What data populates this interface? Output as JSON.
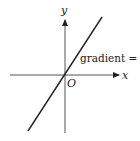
{
  "diagram": {
    "axes": {
      "x_label": "x",
      "y_label": "y",
      "origin_label": "O",
      "origin": [
        65,
        75
      ],
      "x_axis": {
        "from": [
          10,
          75
        ],
        "to": [
          119,
          75
        ]
      },
      "y_axis": {
        "from": [
          65,
          133
        ],
        "to": [
          65,
          20
        ]
      }
    },
    "line": {
      "from": [
        28,
        131
      ],
      "to": [
        102,
        17
      ],
      "annotation": "gradient = 5"
    },
    "colors": {
      "axis": "#555555",
      "line": "#222222",
      "text": "#222222",
      "background": "#ffffff"
    }
  }
}
